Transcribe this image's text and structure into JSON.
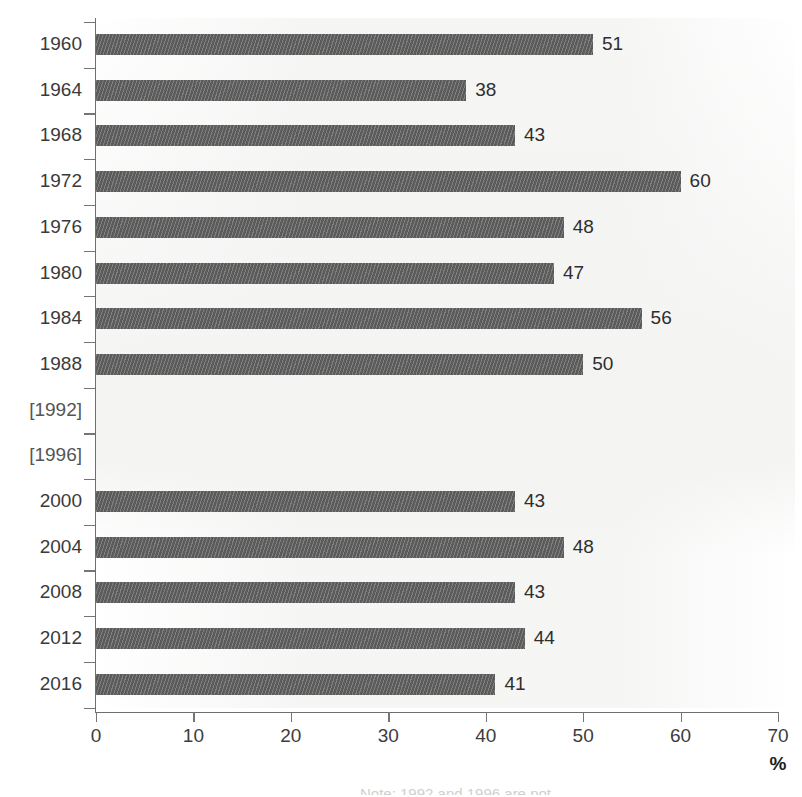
{
  "chart_data": {
    "type": "bar",
    "orientation": "horizontal",
    "title": "",
    "xlabel": "%",
    "ylabel": "",
    "xlim": [
      0,
      70
    ],
    "xticks": [
      0,
      10,
      20,
      30,
      40,
      50,
      60,
      70
    ],
    "grid": false,
    "legend": null,
    "bar_color": "#5b5b5b",
    "categories": [
      "1960",
      "1964",
      "1968",
      "1972",
      "1976",
      "1980",
      "1984",
      "1988",
      "[1992]",
      "[1996]",
      "2000",
      "2004",
      "2008",
      "2012",
      "2016"
    ],
    "values": [
      51,
      38,
      43,
      60,
      48,
      47,
      56,
      50,
      null,
      null,
      43,
      48,
      43,
      44,
      41
    ],
    "value_labels": [
      "51",
      "38",
      "43",
      "60",
      "48",
      "47",
      "56",
      "50",
      "",
      "",
      "43",
      "48",
      "43",
      "44",
      "41"
    ],
    "missing_categories": [
      "[1992]",
      "[1996]"
    ]
  },
  "axis": {
    "x_tick_labels": [
      "0",
      "10",
      "20",
      "30",
      "40",
      "50",
      "60",
      "70"
    ],
    "unit_label": "%"
  },
  "footnote": {
    "text": "Note: 1992 and 1996 are not"
  }
}
